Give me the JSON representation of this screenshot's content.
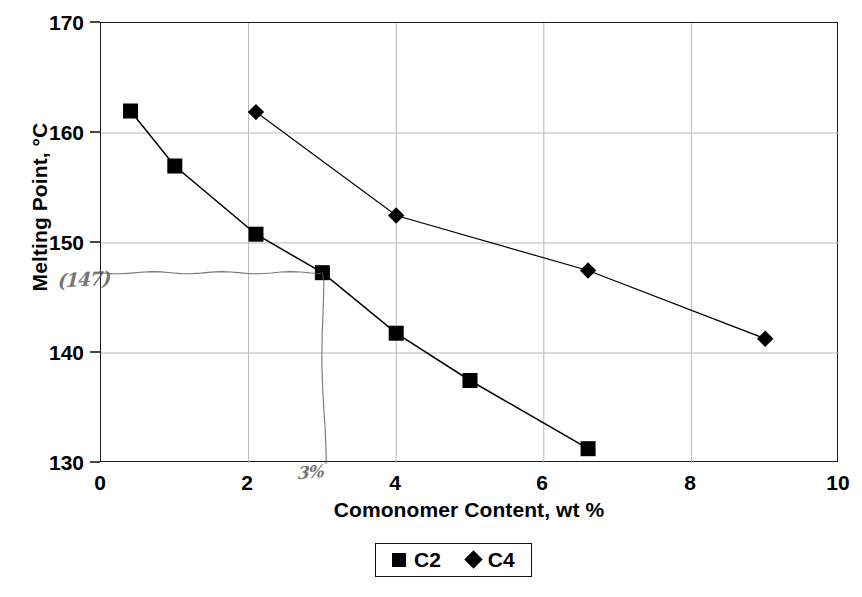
{
  "chart_data": {
    "type": "line",
    "title": "",
    "xlabel": "Comonomer Content, wt %",
    "ylabel": "Melting Point, °C",
    "xlim": [
      0,
      10
    ],
    "ylim": [
      130,
      170
    ],
    "xticks": [
      "0",
      "2",
      "4",
      "6",
      "8",
      "10"
    ],
    "yticks": [
      "130",
      "140",
      "150",
      "160",
      "170"
    ],
    "grid": true,
    "legend_position": "bottom-center",
    "series": [
      {
        "name": "C2",
        "marker": "square",
        "color": "#000000",
        "points": [
          {
            "x": 0.4,
            "y": 162.0
          },
          {
            "x": 1.0,
            "y": 157.0
          },
          {
            "x": 2.1,
            "y": 150.8
          },
          {
            "x": 3.0,
            "y": 147.3
          },
          {
            "x": 4.0,
            "y": 141.8
          },
          {
            "x": 5.0,
            "y": 137.5
          },
          {
            "x": 6.6,
            "y": 131.3
          }
        ]
      },
      {
        "name": "C4",
        "marker": "diamond",
        "color": "#000000",
        "points": [
          {
            "x": 2.1,
            "y": 161.9
          },
          {
            "x": 4.0,
            "y": 152.5
          },
          {
            "x": 6.6,
            "y": 147.5
          },
          {
            "x": 9.0,
            "y": 141.3
          }
        ]
      }
    ],
    "annotations": [
      {
        "name": "handwritten-y-readout",
        "text": "(147)",
        "kind": "handwriting",
        "axis": "y",
        "value": 147.3
      },
      {
        "name": "handwritten-x-readout",
        "text": "3%",
        "kind": "handwriting",
        "axis": "x",
        "value": 3.0
      },
      {
        "name": "handwritten-guide-lines",
        "text": "",
        "kind": "handwriting",
        "description": "hand-drawn horizontal line at 147 from y-axis to the C2 point at 3 wt %, and vertical line from that point down to the x-axis"
      }
    ]
  },
  "legend": {
    "entries": [
      {
        "label": "C2",
        "marker": "square-marker-icon"
      },
      {
        "label": "C4",
        "marker": "diamond-marker-icon"
      }
    ]
  }
}
